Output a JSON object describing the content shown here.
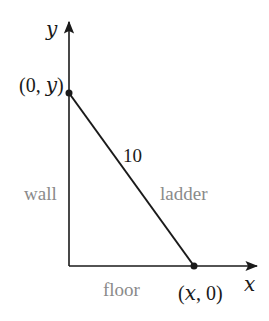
{
  "diagram": {
    "type": "ladder-against-wall",
    "axes": {
      "x_label": "x",
      "y_label": "y"
    },
    "points": {
      "top": {
        "label_prefix": "(0, ",
        "label_var": "y",
        "label_suffix": ")",
        "label": "(0, y)"
      },
      "bottom": {
        "label_prefix": "(",
        "label_var": "x",
        "label_suffix": ", 0)",
        "label": "(x, 0)"
      }
    },
    "segments": {
      "ladder_length": "10"
    },
    "labels": {
      "wall": "wall",
      "ladder": "ladder",
      "floor": "floor"
    },
    "colors": {
      "line": "#1a1a1a",
      "label": "#8a8a8a"
    }
  }
}
